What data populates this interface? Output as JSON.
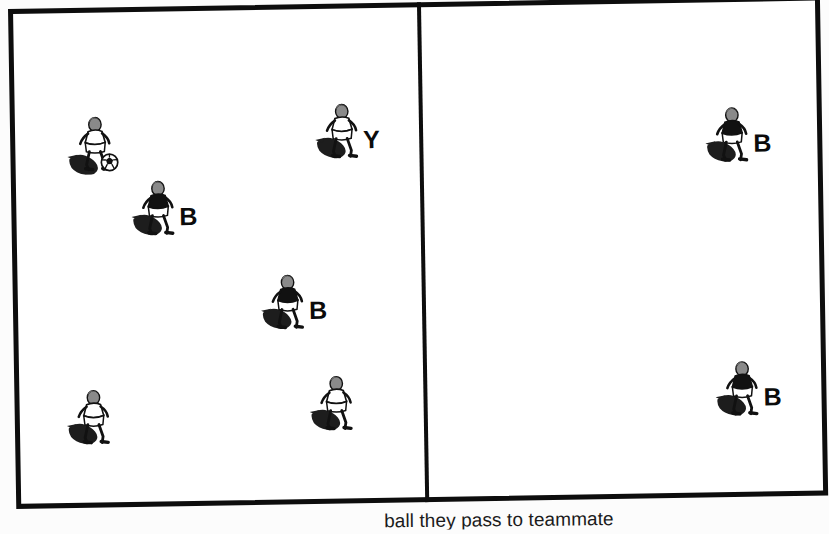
{
  "figure": {
    "kind": "soccer-drill-diagram",
    "title": "",
    "caption_partial": "ball they pass to teammate",
    "panels": [
      {
        "id": "left-grid",
        "name": "left-grid",
        "label": ""
      },
      {
        "id": "right-grid",
        "name": "right-grid",
        "label": ""
      }
    ]
  },
  "colors": {
    "ink": "#0d0d0d",
    "paper": "#ffffff",
    "label": "#0b0b0b"
  },
  "players": {
    "left": [
      {
        "id": "p1",
        "name": "player-with-ball",
        "label": "",
        "kit": "light",
        "has_ball": true,
        "x": 55,
        "y": 105,
        "icon": "soccer-player-dribbling-icon"
      },
      {
        "id": "p2",
        "name": "player-b-upper-left",
        "label": "B",
        "kit": "dark",
        "has_ball": false,
        "x": 120,
        "y": 172,
        "icon": "soccer-player-icon"
      },
      {
        "id": "p3",
        "name": "player-y-upper-right",
        "label": "Y",
        "kit": "light",
        "has_ball": false,
        "x": 305,
        "y": 98,
        "icon": "soccer-player-icon"
      },
      {
        "id": "p4",
        "name": "player-b-center",
        "label": "B",
        "kit": "dark",
        "has_ball": false,
        "x": 248,
        "y": 268,
        "icon": "soccer-player-icon"
      },
      {
        "id": "p5",
        "name": "player-lower-left",
        "label": "",
        "kit": "light",
        "has_ball": false,
        "x": 52,
        "y": 380,
        "icon": "soccer-player-icon"
      },
      {
        "id": "p6",
        "name": "player-lower-center",
        "label": "",
        "kit": "light",
        "has_ball": false,
        "x": 295,
        "y": 370,
        "icon": "soccer-player-icon"
      }
    ],
    "right": [
      {
        "id": "p7",
        "name": "player-b-upper-right-grid",
        "label": "B",
        "kit": "dark",
        "has_ball": false,
        "x": 282,
        "y": 108,
        "icon": "soccer-player-icon"
      },
      {
        "id": "p8",
        "name": "player-b-lower-right-grid",
        "label": "B",
        "kit": "dark",
        "has_ball": false,
        "x": 288,
        "y": 362,
        "icon": "soccer-player-icon"
      }
    ]
  }
}
